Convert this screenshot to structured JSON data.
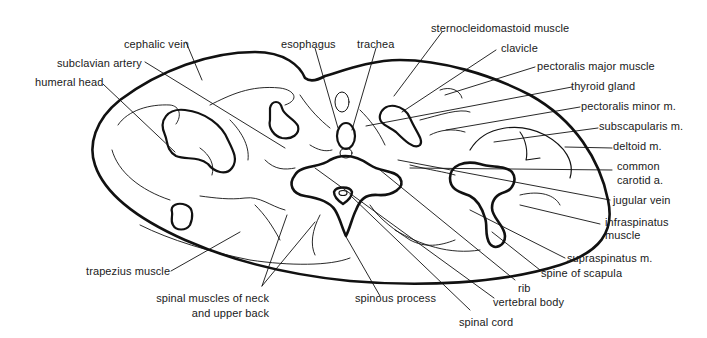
{
  "figure": {
    "type": "anatomical cross-section",
    "labels": {
      "cephalic_vein": "cephalic vein",
      "subclavian_artery": "subclavian artery",
      "humeral_head": "humeral head",
      "esophagus": "esophagus",
      "trachea": "trachea",
      "sternocleidomastoid": "sternocleidomastoid muscle",
      "clavicle": "clavicle",
      "pectoralis_major": "pectoralis major muscle",
      "thyroid_gland": "thyroid gland",
      "pectoralis_minor": "pectoralis minor m.",
      "subscapularis": "subscapularis m.",
      "deltoid": "deltoid m.",
      "common_carotid_1": "common",
      "common_carotid_2": "carotid a.",
      "jugular_vein": "jugular vein",
      "infraspinatus_1": "infraspinatus",
      "infraspinatus_2": "muscle",
      "supraspinatus": "supraspinatus m.",
      "spine_of_scapula": "spine of scapula",
      "rib": "rib",
      "vertebral_body": "vertebral body",
      "spinal_cord": "spinal cord",
      "spinous_process": "spinous process",
      "spinal_muscles_1": "spinal muscles of neck",
      "spinal_muscles_2": "and upper back",
      "trapezius": "trapezius muscle"
    },
    "colors": {
      "ink": "#111111",
      "background": "#ffffff"
    }
  }
}
